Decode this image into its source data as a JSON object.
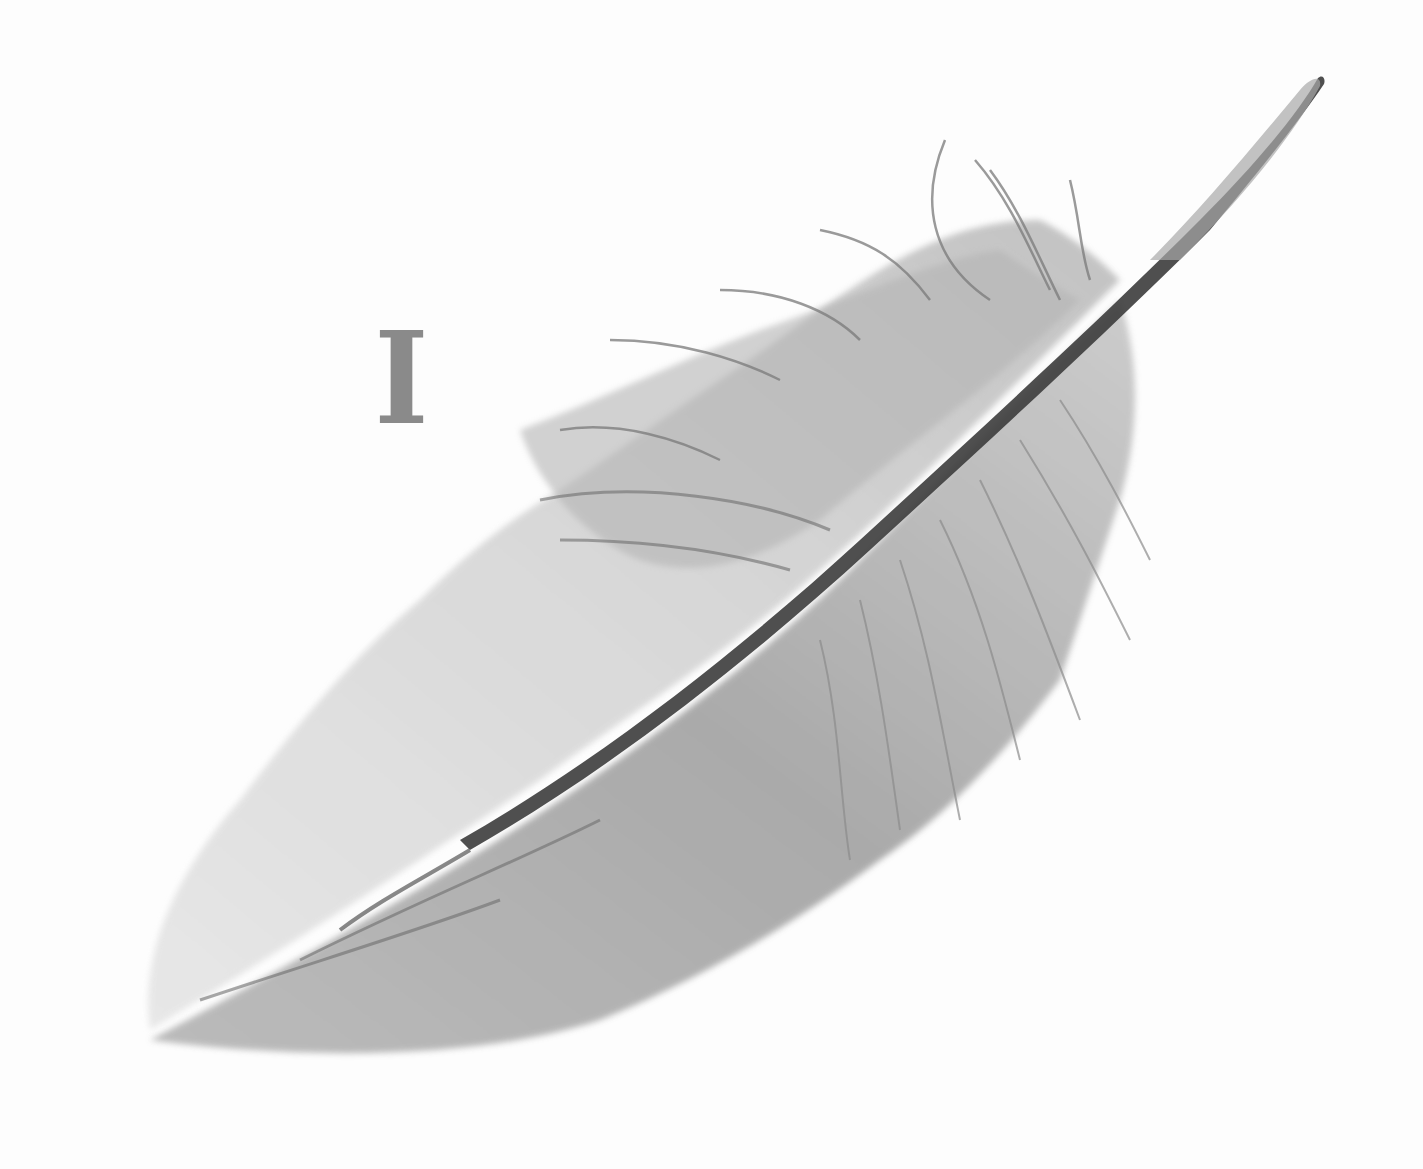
{
  "illustration": {
    "subject": "feather",
    "style": "grayscale watercolor sketch",
    "glyph": "I",
    "colors": {
      "background": "#fdfdfd",
      "glyph": "#8a8a8a",
      "shaft": "#3c3c3c",
      "vane_dark": "#9a9a9a",
      "vane_light": "#d6d6d6"
    }
  }
}
